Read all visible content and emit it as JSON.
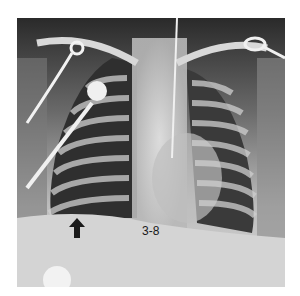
{
  "figure": {
    "type": "chest radiograph",
    "label": "3-8",
    "annotation": "arrow pointing to right lung base"
  },
  "colors": {
    "background": "#ffffff",
    "film_dark": "#2e2e2e",
    "film_light": "#d8d8d8",
    "arrow": "#1a1a1a"
  }
}
